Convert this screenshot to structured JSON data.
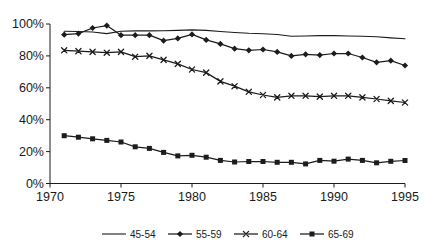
{
  "page": {
    "background": "#ffffff"
  },
  "chart_data": {
    "type": "line",
    "title": "",
    "xlabel": "",
    "ylabel": "",
    "grid": false,
    "legend_position": "bottom-center",
    "line_color": "#1c1c1c",
    "xlim": [
      1970,
      1995
    ],
    "ylim": [
      0,
      100
    ],
    "x_tick_values": [
      1970,
      1975,
      1980,
      1985,
      1990,
      1995
    ],
    "x_tick_labels": [
      "1970",
      "1975",
      "1980",
      "1985",
      "1990",
      "1995"
    ],
    "y_tick_values": [
      0,
      20,
      40,
      60,
      80,
      100
    ],
    "y_tick_labels": [
      "0%",
      "20%",
      "40%",
      "60%",
      "80%",
      "100%"
    ],
    "x": [
      1971,
      1972,
      1973,
      1974,
      1975,
      1976,
      1977,
      1978,
      1979,
      1980,
      1981,
      1982,
      1983,
      1984,
      1985,
      1986,
      1987,
      1988,
      1989,
      1990,
      1991,
      1992,
      1993,
      1994,
      1995
    ],
    "series": [
      {
        "name": "45-54",
        "marker": "none",
        "values": [
          95.5,
          95.3,
          95.0,
          94.0,
          95.5,
          95.7,
          95.7,
          95.8,
          96.0,
          96.3,
          96.0,
          95.3,
          94.7,
          94.2,
          93.9,
          93.4,
          92.3,
          92.5,
          92.7,
          92.7,
          92.5,
          92.3,
          92.0,
          91.3,
          90.8
        ]
      },
      {
        "name": "55-59",
        "marker": "diamond",
        "values": [
          93.3,
          94.0,
          97.5,
          99.0,
          93.0,
          93.0,
          93.0,
          89.5,
          91.0,
          93.5,
          90.0,
          87.5,
          84.5,
          83.5,
          84.0,
          82.5,
          80.0,
          81.0,
          80.5,
          81.5,
          81.5,
          79.0,
          76.0,
          77.0,
          74.0
        ]
      },
      {
        "name": "60-64",
        "marker": "x",
        "values": [
          83.5,
          83.0,
          82.5,
          82.0,
          82.5,
          79.5,
          80.0,
          77.5,
          75.0,
          71.5,
          69.5,
          64.0,
          61.0,
          57.5,
          55.5,
          54.0,
          55.0,
          55.0,
          54.5,
          55.0,
          55.0,
          54.0,
          53.0,
          51.8,
          50.8
        ]
      },
      {
        "name": "65-69",
        "marker": "square",
        "values": [
          30.0,
          29.0,
          28.0,
          27.0,
          26.0,
          23.0,
          22.0,
          19.5,
          17.3,
          17.7,
          16.5,
          14.5,
          13.5,
          13.8,
          13.8,
          13.3,
          13.3,
          12.3,
          14.5,
          14.0,
          15.3,
          14.5,
          13.0,
          13.9,
          14.4
        ]
      }
    ]
  }
}
